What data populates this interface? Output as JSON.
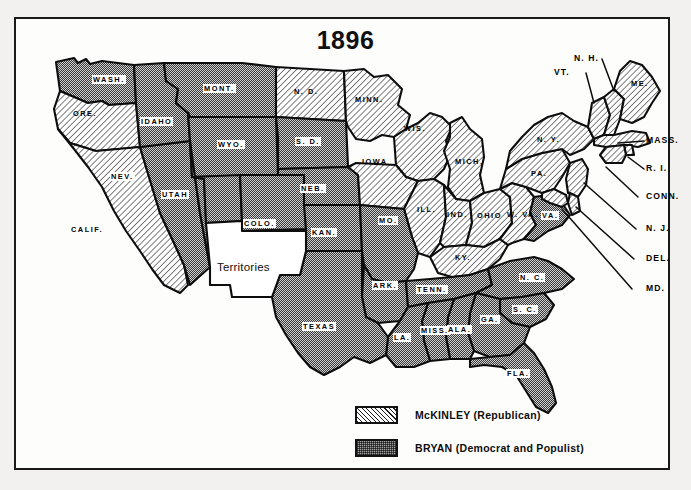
{
  "title": "1896",
  "legend": {
    "items": [
      {
        "pattern": "diagonal-hatch",
        "label": "McKINLEY (Republican)",
        "swatch_name": "mckinley-swatch"
      },
      {
        "pattern": "gray-stipple",
        "label": "BRYAN (Democrat and Populist)",
        "swatch_name": "bryan-swatch"
      }
    ]
  },
  "territories": {
    "label": "Territories",
    "pattern": "none"
  },
  "states": {
    "wash": {
      "label": "WASH.",
      "party": "bryan"
    },
    "ore": {
      "label": "ORE.",
      "party": "mckinley"
    },
    "calif": {
      "label": "CALIF.",
      "party": "mckinley"
    },
    "nev": {
      "label": "NEV.",
      "party": "bryan"
    },
    "idaho": {
      "label": "IDAHO",
      "party": "bryan"
    },
    "mont": {
      "label": "MONT.",
      "party": "bryan"
    },
    "wyo": {
      "label": "WYO.",
      "party": "bryan"
    },
    "utah": {
      "label": "UTAH",
      "party": "bryan"
    },
    "colo": {
      "label": "COLO.",
      "party": "bryan"
    },
    "nd": {
      "label": "N. D.",
      "party": "mckinley"
    },
    "sd": {
      "label": "S. D.",
      "party": "bryan"
    },
    "neb": {
      "label": "NEB.",
      "party": "bryan"
    },
    "kan": {
      "label": "KAN.",
      "party": "bryan"
    },
    "minn": {
      "label": "MINN.",
      "party": "mckinley"
    },
    "iowa": {
      "label": "IOWA",
      "party": "mckinley"
    },
    "mo": {
      "label": "MO.",
      "party": "bryan"
    },
    "ark": {
      "label": "ARK.",
      "party": "bryan"
    },
    "la": {
      "label": "LA.",
      "party": "bryan"
    },
    "texas": {
      "label": "TEXAS",
      "party": "bryan"
    },
    "wis": {
      "label": "WIS.",
      "party": "mckinley"
    },
    "mich": {
      "label": "MICH.",
      "party": "mckinley"
    },
    "ill": {
      "label": "ILL.",
      "party": "mckinley"
    },
    "ind": {
      "label": "IND.",
      "party": "mckinley"
    },
    "ohio": {
      "label": "OHIO",
      "party": "mckinley"
    },
    "ky": {
      "label": "KY.",
      "party": "mckinley"
    },
    "tenn": {
      "label": "TENN.",
      "party": "bryan"
    },
    "miss": {
      "label": "MISS.",
      "party": "bryan"
    },
    "ala": {
      "label": "ALA.",
      "party": "bryan"
    },
    "ga": {
      "label": "GA.",
      "party": "bryan"
    },
    "fla": {
      "label": "FLA.",
      "party": "bryan"
    },
    "sc": {
      "label": "S. C.",
      "party": "bryan"
    },
    "nc": {
      "label": "N. C.",
      "party": "bryan"
    },
    "va": {
      "label": "VA.",
      "party": "bryan"
    },
    "wva": {
      "label": "W. VA.",
      "party": "mckinley"
    },
    "pa": {
      "label": "PA.",
      "party": "mckinley"
    },
    "ny": {
      "label": "N. Y.",
      "party": "mckinley"
    },
    "me": {
      "label": "ME.",
      "party": "mckinley"
    }
  },
  "callouts": [
    {
      "key": "nh",
      "label": "N. H.",
      "party": "mckinley"
    },
    {
      "key": "vt",
      "label": "VT.",
      "party": "mckinley"
    },
    {
      "key": "mass",
      "label": "MASS.",
      "party": "mckinley"
    },
    {
      "key": "ri",
      "label": "R. I.",
      "party": "mckinley"
    },
    {
      "key": "conn",
      "label": "CONN.",
      "party": "mckinley"
    },
    {
      "key": "nj",
      "label": "N. J.",
      "party": "mckinley"
    },
    {
      "key": "del",
      "label": "DEL.",
      "party": "mckinley"
    },
    {
      "key": "md",
      "label": "MD.",
      "party": "mckinley"
    }
  ],
  "colors": {
    "ink": "#1a1a1a",
    "paper": "#fdfdfc",
    "page_background": "#f3f1ef",
    "bryan_gray": "#9c9c9c"
  }
}
